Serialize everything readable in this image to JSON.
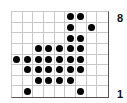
{
  "board": {
    "columns": 9,
    "rows": 8,
    "row_labels": {
      "top": "8",
      "bottom": "1"
    },
    "dot_color": "#000000",
    "grid_color": "#c8c8c8",
    "dots": [
      [
        0,
        0,
        0,
        0,
        0,
        1,
        1,
        0,
        0
      ],
      [
        0,
        0,
        0,
        0,
        0,
        1,
        0,
        1,
        0
      ],
      [
        0,
        0,
        0,
        0,
        0,
        1,
        1,
        0,
        0
      ],
      [
        0,
        0,
        1,
        1,
        1,
        1,
        1,
        0,
        0
      ],
      [
        1,
        1,
        1,
        1,
        1,
        1,
        1,
        0,
        0
      ],
      [
        0,
        1,
        1,
        1,
        1,
        1,
        1,
        0,
        0
      ],
      [
        0,
        0,
        1,
        1,
        1,
        1,
        0,
        0,
        0
      ],
      [
        0,
        1,
        0,
        0,
        0,
        0,
        1,
        0,
        0
      ]
    ]
  }
}
